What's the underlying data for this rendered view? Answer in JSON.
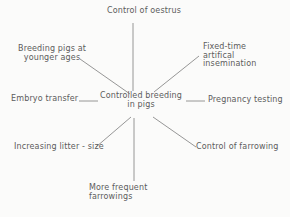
{
  "figure": {
    "center": "Controlled breeding\nin pigs",
    "nodes": {
      "top": "Control of oestrus",
      "top_right": "Fixed-time\nartifical\ninsemination",
      "right": "Pregnancy testing",
      "bottom_right": "Control of farrowing",
      "bottom": "More frequent\nfarrowings",
      "bottom_left": "Increasing litter - size",
      "left": "Embryo transfer",
      "top_left": "Breeding pigs at\nyounger ages"
    }
  },
  "colors": {
    "text": "#5c5c5c",
    "line": "#8a8a8a",
    "background": "#fbfbfa"
  }
}
